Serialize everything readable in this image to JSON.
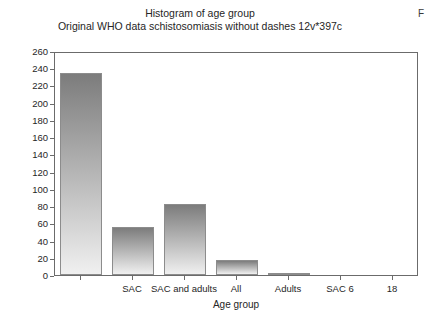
{
  "chart_data": {
    "type": "bar",
    "title": "Histogram of age group",
    "subtitle": "Original WHO data schistosomiasis without dashes 12v*397c",
    "xlabel": "Age group",
    "ylabel": "No of obs",
    "categories": [
      "",
      "SAC",
      "SAC and adults",
      "All",
      "Adults",
      "SAC 6",
      "18"
    ],
    "values": [
      235,
      56,
      83,
      18,
      2,
      0,
      0
    ],
    "ylim": [
      0,
      260
    ],
    "ytick_step": 20,
    "yticks": [
      0,
      20,
      40,
      60,
      80,
      100,
      120,
      140,
      160,
      180,
      200,
      220,
      240,
      260
    ],
    "grid": false,
    "legend": "none",
    "bar_gradient_top": "#7c7c7c",
    "bar_gradient_bottom": "#f0f0f0",
    "bar_border": "#8c8c8c",
    "axis_color": "#6b6b6b",
    "text_color": "#262626"
  },
  "corner": {
    "glyph": "F"
  }
}
